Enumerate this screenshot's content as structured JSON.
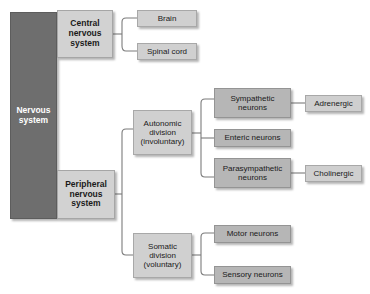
{
  "diagram": {
    "type": "hierarchy-tree",
    "colors": {
      "root_fill": "#6e6e6e",
      "root_text": "#ffffff",
      "level1_fill": "#d2d2d2",
      "level2_fill": "#d0d0d0",
      "level3_fill": "#b6b6b6",
      "level4_fill": "#cfcfcf",
      "connector": "#7b7b7b",
      "background": "#ffffff"
    },
    "nodes": {
      "root": {
        "label": "Nervous\nsystem",
        "line1": "Nervous",
        "line2": "system"
      },
      "cns": {
        "line1": "Central",
        "line2": "nervous",
        "line3": "system"
      },
      "brain": {
        "label": "Brain"
      },
      "spinal_cord": {
        "label": "Spinal cord"
      },
      "pns": {
        "line1": "Peripheral",
        "line2": "nervous",
        "line3": "system"
      },
      "autonomic": {
        "line1": "Autonomic",
        "line2": "division",
        "line3": "(involuntary)"
      },
      "somatic": {
        "line1": "Somatic",
        "line2": "division",
        "line3": "(voluntary)"
      },
      "sympathetic": {
        "line1": "Sympathetic",
        "line2": "neurons"
      },
      "enteric": {
        "label": "Enteric neurons"
      },
      "parasympathetic": {
        "line1": "Parasympathetic",
        "line2": "neurons"
      },
      "adrenergic": {
        "label": "Adrenergic"
      },
      "cholinergic": {
        "label": "Cholinergic"
      },
      "motor": {
        "label": "Motor neurons"
      },
      "sensory": {
        "label": "Sensory neurons"
      }
    },
    "edges": [
      {
        "from": "root",
        "to": "cns"
      },
      {
        "from": "root",
        "to": "pns"
      },
      {
        "from": "cns",
        "to": "brain"
      },
      {
        "from": "cns",
        "to": "spinal_cord"
      },
      {
        "from": "pns",
        "to": "autonomic"
      },
      {
        "from": "pns",
        "to": "somatic"
      },
      {
        "from": "autonomic",
        "to": "sympathetic"
      },
      {
        "from": "autonomic",
        "to": "enteric"
      },
      {
        "from": "autonomic",
        "to": "parasympathetic"
      },
      {
        "from": "sympathetic",
        "to": "adrenergic"
      },
      {
        "from": "parasympathetic",
        "to": "cholinergic"
      },
      {
        "from": "somatic",
        "to": "motor"
      },
      {
        "from": "somatic",
        "to": "sensory"
      }
    ]
  }
}
